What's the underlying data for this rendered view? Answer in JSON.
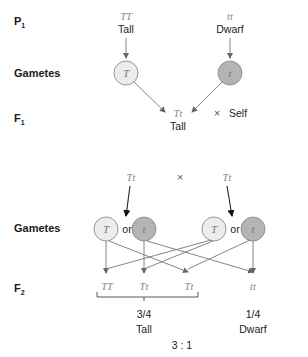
{
  "row_labels": {
    "p1": "P",
    "p1_sub": "1",
    "gametes1": "Gametes",
    "f1": "F",
    "f1_sub": "1",
    "gametes2": "Gametes",
    "f2": "F",
    "f2_sub": "2"
  },
  "p1": {
    "left": {
      "genotype": "TT",
      "phenotype": "Tall"
    },
    "right": {
      "genotype": "tt",
      "phenotype": "Dwarf"
    }
  },
  "gametes1": {
    "left": "T",
    "right": "t"
  },
  "f1": {
    "genotype": "Tt",
    "phenotype": "Tall",
    "cross_symbol": "×",
    "self_label": "Self"
  },
  "cross2": {
    "left": "Tt",
    "symbol": "×",
    "right": "Tt"
  },
  "gametes2": {
    "left_a": "T",
    "left_or": "or",
    "left_b": "t",
    "right_a": "T",
    "right_or": "or",
    "right_b": "t"
  },
  "f2": {
    "genotypes": [
      "TT",
      "Tt",
      "Tt",
      "tt"
    ],
    "tall_fraction": "3/4",
    "tall_label": "Tall",
    "dwarf_fraction": "1/4",
    "dwarf_label": "Dwarf",
    "ratio": "3 : 1"
  },
  "colors": {
    "dominant_gamete": "#ececec",
    "recessive_gamete": "#b4b4b4",
    "genotype_text": "#888888"
  }
}
